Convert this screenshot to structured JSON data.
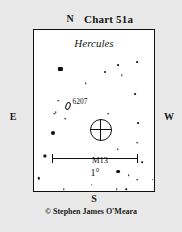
{
  "chart_data": {
    "type": "scatter",
    "title": "Chart 51a",
    "subtitle": "Hercules",
    "xlabel": "",
    "ylabel": "",
    "grid": false,
    "legend_position": "none",
    "projection": "star-chart",
    "orientation": {
      "north": "N",
      "south": "S",
      "east": "E",
      "west": "W",
      "note": "north up, east left (mirror-reversed sky view)"
    },
    "scale": {
      "label": "1°",
      "length_degrees": 1
    },
    "field_width_degrees": 1.42,
    "field_height_degrees": 1.9,
    "deep_sky_objects": [
      {
        "name": "M13",
        "label": "M13",
        "symbol": "circle-with-crosshair",
        "x": 55.5,
        "y": 62,
        "size": 22,
        "label_x": 55,
        "label_y": 78
      },
      {
        "name": "NGC 6207",
        "label": "6207",
        "symbol": "ellipse",
        "x": 28,
        "y": 47,
        "label_x": 32,
        "label_y": 42
      }
    ],
    "stars": [
      {
        "x": 22,
        "y": 24,
        "mag": 6.0,
        "size": 4.2,
        "shape": "square"
      },
      {
        "x": 59,
        "y": 26,
        "mag": 8.6,
        "size": 2.0,
        "shape": "round"
      },
      {
        "x": 70,
        "y": 22,
        "mag": 8.8,
        "size": 1.8,
        "shape": "round"
      },
      {
        "x": 73,
        "y": 28,
        "mag": 9.4,
        "size": 1.5,
        "shape": "round"
      },
      {
        "x": 86,
        "y": 20,
        "mag": 8.9,
        "size": 1.8,
        "shape": "round"
      },
      {
        "x": 43,
        "y": 33,
        "mag": 9.2,
        "size": 1.6,
        "shape": "round"
      },
      {
        "x": 20,
        "y": 44,
        "mag": 9.3,
        "size": 1.5,
        "shape": "round"
      },
      {
        "x": 18,
        "y": 51,
        "mag": 9.3,
        "size": 1.5,
        "shape": "round"
      },
      {
        "x": 26,
        "y": 55,
        "mag": 9.3,
        "size": 1.5,
        "shape": "round"
      },
      {
        "x": 84,
        "y": 40,
        "mag": 8.8,
        "size": 1.8,
        "shape": "round"
      },
      {
        "x": 62,
        "y": 52,
        "mag": 9.4,
        "size": 1.4,
        "shape": "round"
      },
      {
        "x": 17,
        "y": 52,
        "mag": 9.4,
        "size": 1.4,
        "shape": "round"
      },
      {
        "x": 16,
        "y": 64,
        "mag": 6.4,
        "size": 4.0,
        "shape": "round"
      },
      {
        "x": 9,
        "y": 78,
        "mag": 7.2,
        "size": 3.2,
        "shape": "square"
      },
      {
        "x": 4,
        "y": 92,
        "mag": 8.2,
        "size": 2.4,
        "shape": "round"
      },
      {
        "x": 70,
        "y": 74,
        "mag": 9.4,
        "size": 1.4,
        "shape": "round"
      },
      {
        "x": 87,
        "y": 58,
        "mag": 8.8,
        "size": 1.8,
        "shape": "round"
      },
      {
        "x": 86,
        "y": 70,
        "mag": 8.9,
        "size": 1.7,
        "shape": "round"
      },
      {
        "x": 90,
        "y": 82,
        "mag": 8.9,
        "size": 1.7,
        "shape": "round"
      },
      {
        "x": 99,
        "y": 93,
        "mag": 9.0,
        "size": 1.7,
        "shape": "round"
      },
      {
        "x": 70,
        "y": 88,
        "mag": 6.6,
        "size": 3.8,
        "shape": "round"
      },
      {
        "x": 79,
        "y": 90,
        "mag": 9.0,
        "size": 1.7,
        "shape": "round"
      },
      {
        "x": 86,
        "y": 93,
        "mag": 9.2,
        "size": 1.5,
        "shape": "round"
      },
      {
        "x": 48,
        "y": 96,
        "mag": 9.2,
        "size": 1.5,
        "shape": "round"
      },
      {
        "x": 69,
        "y": 99,
        "mag": 9.2,
        "size": 1.5,
        "shape": "round"
      },
      {
        "x": 77,
        "y": 99,
        "mag": 9.2,
        "size": 1.5,
        "shape": "round"
      },
      {
        "x": 25,
        "y": 99,
        "mag": 9.4,
        "size": 1.4,
        "shape": "round"
      }
    ]
  },
  "header": {
    "title": "Chart 51a"
  },
  "directions": {
    "north": "N",
    "south": "S",
    "east": "E",
    "west": "W"
  },
  "panel": {
    "constellation": "Hercules"
  },
  "scale": {
    "label": "1°"
  },
  "credit": {
    "text": "© Stephen James O'Meara"
  },
  "colors": {
    "background": "#e9e9e9",
    "panel": "#ffffff",
    "ink": "#111111"
  }
}
